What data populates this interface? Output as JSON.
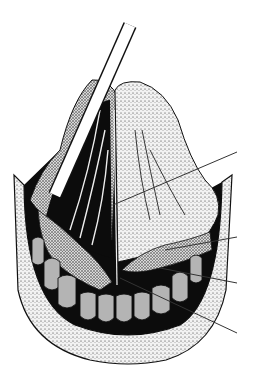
{
  "figure": {
    "text_labels": [],
    "colors": {
      "background": "#ffffff",
      "ink": "#111111",
      "stipple_fill": "#e8e8e8",
      "teeth": "#b4b4b4",
      "leader_line": "#333333"
    },
    "instrument": {
      "from": [
        130,
        25
      ],
      "to": [
        55,
        195
      ],
      "width": 12
    },
    "leader_lines": [
      {
        "id": "pointer-1",
        "from": [
          113,
          205
        ],
        "to": [
          237,
          152
        ]
      },
      {
        "id": "pointer-2",
        "from": [
          165,
          250
        ],
        "to": [
          237,
          237
        ]
      },
      {
        "id": "pointer-3",
        "from": [
          160,
          268
        ],
        "to": [
          237,
          283
        ]
      },
      {
        "id": "pointer-4",
        "from": [
          120,
          278
        ],
        "to": [
          237,
          333
        ]
      }
    ],
    "lower_teeth_count": 10
  }
}
